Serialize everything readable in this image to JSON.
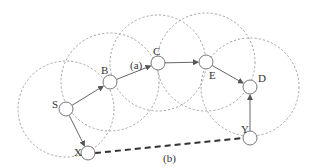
{
  "diagram": {
    "nodes": [
      {
        "id": "S",
        "label": "S",
        "x": 66,
        "y": 109,
        "lx": 52,
        "ly": 108
      },
      {
        "id": "B",
        "label": "B",
        "x": 110,
        "y": 82,
        "lx": 101,
        "ly": 74
      },
      {
        "id": "C",
        "label": "C",
        "x": 158,
        "y": 63,
        "lx": 153,
        "ly": 55
      },
      {
        "id": "E",
        "label": "E",
        "x": 206,
        "y": 62,
        "lx": 209,
        "ly": 79
      },
      {
        "id": "D",
        "label": "D",
        "x": 250,
        "y": 87,
        "lx": 258,
        "ly": 82
      },
      {
        "id": "Y",
        "label": "Y",
        "x": 250,
        "y": 138,
        "lx": 241,
        "ly": 133
      },
      {
        "id": "X",
        "label": "X",
        "x": 88,
        "y": 153,
        "lx": 74,
        "ly": 156
      }
    ],
    "ranges": [
      {
        "node": "S",
        "r": 48
      },
      {
        "node": "B",
        "r": 49
      },
      {
        "node": "C",
        "r": 48
      },
      {
        "node": "E",
        "r": 49
      },
      {
        "node": "D",
        "r": 49
      }
    ],
    "edges": [
      {
        "from": "S",
        "to": "B"
      },
      {
        "from": "B",
        "to": "C"
      },
      {
        "from": "C",
        "to": "E"
      },
      {
        "from": "E",
        "to": "D"
      },
      {
        "from": "S",
        "to": "X"
      },
      {
        "from": "Y",
        "to": "D"
      }
    ],
    "annotations": [
      {
        "text": "(a)",
        "x": 130,
        "y": 69
      },
      {
        "text": "(b)",
        "x": 163,
        "y": 162
      }
    ],
    "dashed_link": {
      "from": "X",
      "to": "Y"
    },
    "colors": {
      "range": "#9a9a9a",
      "edge": "#666666",
      "node": "#777777",
      "dashed": "#333333"
    }
  }
}
